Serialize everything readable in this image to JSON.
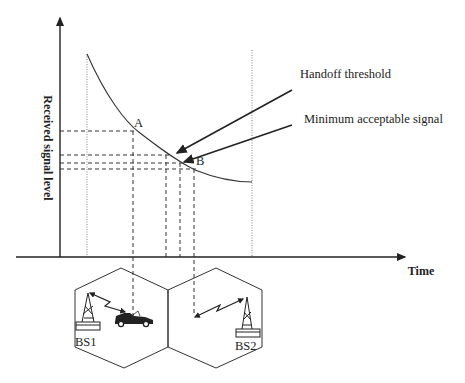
{
  "diagram": {
    "type": "handoff-signal-level",
    "y_axis_label": "Received signal level",
    "x_axis_label": "Time",
    "points": [
      {
        "id": "A",
        "label": "A"
      },
      {
        "id": "B",
        "label": "B"
      }
    ],
    "annotations": {
      "handoff_threshold": "Handoff threshold",
      "minimum_signal": "Minimum acceptable signal"
    },
    "cells": [
      {
        "id": "bs1",
        "label": "BS1"
      },
      {
        "id": "bs2",
        "label": "BS2"
      }
    ],
    "colors": {
      "line": "#222222",
      "background": "#ffffff"
    }
  }
}
